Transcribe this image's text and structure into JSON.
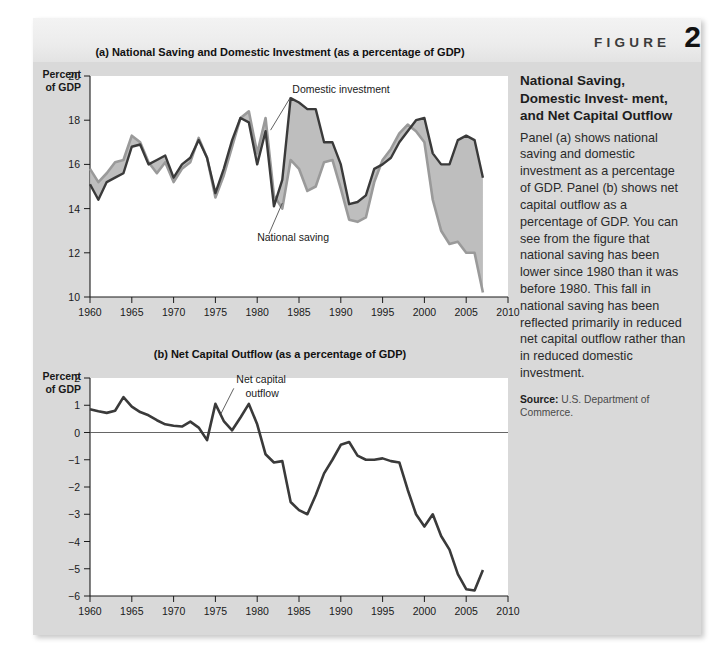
{
  "figure": {
    "word": "FIGURE",
    "number": "2"
  },
  "sidebar": {
    "title": "National Saving, Domestic Invest- ment, and Net Capital Outflow",
    "body": "Panel (a) shows national saving and domestic investment as a percentage of GDP. Panel (b) shows net capital outflow as a percentage of GDP. You can see from the figure that national saving has been lower since 1980 than it was before 1980. This fall in national saving has been reflected primarily in reduced net capital outflow rather than in reduced domestic investment.",
    "source_label": "Source:",
    "source_text": " U.S. Department of Commerce."
  },
  "colors": {
    "panel_bg": "#d9d9d9",
    "plot_bg": "#ffffff",
    "investment_line": "#3a3a3a",
    "saving_line": "#9a9a9a",
    "gap_fill": "#b8b8b8",
    "axis": "#1a1a1a"
  },
  "chart_data": [
    {
      "type": "line",
      "panel": "a",
      "title": "(a) National Saving and Domestic Investment (as a percentage of GDP)",
      "ylabel": "Percent of GDP",
      "xlabel": "",
      "xlim": [
        1960,
        2010
      ],
      "ylim": [
        10,
        20
      ],
      "yticks": [
        10,
        12,
        14,
        16,
        18,
        20
      ],
      "xticks": [
        1960,
        1965,
        1970,
        1975,
        1980,
        1985,
        1990,
        1995,
        2000,
        2005,
        2010
      ],
      "grid": false,
      "legend": "annotations",
      "annotations": [
        {
          "text": "Domestic investment",
          "x": 1984.2,
          "y": 19.25
        },
        {
          "text": "National saving",
          "x": 1980.0,
          "y": 12.55
        }
      ],
      "x": [
        1960,
        1961,
        1962,
        1963,
        1964,
        1965,
        1966,
        1967,
        1968,
        1969,
        1970,
        1971,
        1972,
        1973,
        1974,
        1975,
        1976,
        1977,
        1978,
        1979,
        1980,
        1981,
        1982,
        1983,
        1984,
        1985,
        1986,
        1987,
        1988,
        1989,
        1990,
        1991,
        1992,
        1993,
        1994,
        1995,
        1996,
        1997,
        1998,
        1999,
        2000,
        2001,
        2002,
        2003,
        2004,
        2005,
        2006,
        2007
      ],
      "series": [
        {
          "name": "Domestic investment",
          "values": [
            15.1,
            14.4,
            15.2,
            15.4,
            15.6,
            16.8,
            16.9,
            16.0,
            16.2,
            16.4,
            15.4,
            16.0,
            16.3,
            17.1,
            16.3,
            14.7,
            15.8,
            17.1,
            18.1,
            17.9,
            16.0,
            17.5,
            14.1,
            15.3,
            19.0,
            18.8,
            18.5,
            18.5,
            17.0,
            17.0,
            16.0,
            14.2,
            14.3,
            14.6,
            15.8,
            16.0,
            16.3,
            17.0,
            17.5,
            18.0,
            18.1,
            16.5,
            16.0,
            16.0,
            17.1,
            17.3,
            17.1,
            15.4
          ]
        },
        {
          "name": "National saving",
          "values": [
            15.8,
            15.2,
            15.6,
            16.1,
            16.2,
            17.3,
            17.0,
            16.1,
            15.6,
            16.1,
            15.2,
            15.8,
            16.1,
            17.2,
            16.3,
            14.5,
            15.5,
            16.8,
            18.1,
            18.4,
            16.5,
            18.1,
            14.6,
            14.0,
            16.2,
            15.8,
            14.8,
            15.0,
            16.1,
            16.2,
            14.9,
            13.5,
            13.4,
            13.6,
            15.2,
            16.2,
            16.7,
            17.4,
            17.8,
            17.5,
            17.0,
            14.4,
            13.0,
            12.4,
            12.5,
            12.0,
            12.0,
            10.2
          ]
        }
      ]
    },
    {
      "type": "line",
      "panel": "b",
      "title": "(b) Net Capital Outflow (as a percentage of GDP)",
      "ylabel": "Percent of GDP",
      "xlabel": "",
      "xlim": [
        1960,
        2010
      ],
      "ylim": [
        -6,
        2
      ],
      "yticks": [
        -6,
        -5,
        -4,
        -3,
        -2,
        -1,
        0,
        1,
        2
      ],
      "xticks": [
        1960,
        1965,
        1970,
        1975,
        1980,
        1985,
        1990,
        1995,
        2000,
        2005,
        2010
      ],
      "grid": false,
      "legend": "annotations",
      "annotations": [
        {
          "text": "Net capital",
          "x": 1977.5,
          "y": 1.8
        },
        {
          "text": "outflow",
          "x": 1978.6,
          "y": 1.32
        }
      ],
      "x": [
        1960,
        1961,
        1962,
        1963,
        1964,
        1965,
        1966,
        1967,
        1968,
        1969,
        1970,
        1971,
        1972,
        1973,
        1974,
        1975,
        1976,
        1977,
        1978,
        1979,
        1980,
        1981,
        1982,
        1983,
        1984,
        1985,
        1986,
        1987,
        1988,
        1989,
        1990,
        1991,
        1992,
        1993,
        1994,
        1995,
        1996,
        1997,
        1998,
        1999,
        2000,
        2001,
        2002,
        2003,
        2004,
        2005,
        2006,
        2007
      ],
      "series": [
        {
          "name": "Net capital outflow",
          "values": [
            0.85,
            0.78,
            0.72,
            0.8,
            1.3,
            0.95,
            0.75,
            0.63,
            0.45,
            0.3,
            0.25,
            0.22,
            0.4,
            0.18,
            -0.28,
            1.05,
            0.42,
            0.08,
            0.55,
            1.05,
            0.3,
            -0.8,
            -1.1,
            -1.05,
            -2.55,
            -2.85,
            -3.0,
            -2.3,
            -1.5,
            -1.0,
            -0.45,
            -0.35,
            -0.85,
            -1.0,
            -1.0,
            -0.95,
            -1.05,
            -1.1,
            -2.1,
            -3.0,
            -3.45,
            -3.0,
            -3.8,
            -4.3,
            -5.2,
            -5.75,
            -5.8,
            -5.05
          ]
        }
      ]
    }
  ]
}
